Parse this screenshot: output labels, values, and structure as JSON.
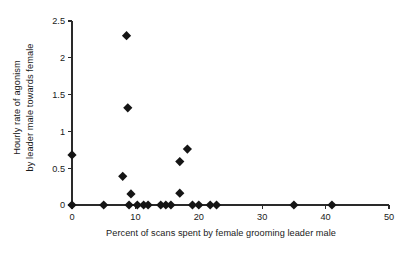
{
  "chart_data": {
    "type": "scatter",
    "title": "",
    "xlabel": "Percent of scans spent by female grooming leader male",
    "ylabel": "Hourly rate of agonism by leader male towards female",
    "ylabel_line1": "Hourly rate of agonism",
    "ylabel_line2": "by leader male towards female",
    "xlim": [
      0,
      50
    ],
    "ylim": [
      0,
      2.5
    ],
    "xticks": [
      0,
      10,
      20,
      30,
      40,
      50
    ],
    "xticklabels": [
      "0",
      "10",
      "20",
      "30",
      "40",
      "50"
    ],
    "yticks": [
      0,
      0.5,
      1,
      1.5,
      2,
      2.5
    ],
    "yticklabels": [
      "0",
      "0.5",
      "1",
      "1.5",
      "2",
      "2.5"
    ],
    "grid": false,
    "legend": false,
    "marker": "diamond",
    "marker_color": "#151515",
    "marker_size": 4.6,
    "points": [
      {
        "x": 0.0,
        "y": 0.68
      },
      {
        "x": 0.0,
        "y": 0.0
      },
      {
        "x": 5.0,
        "y": 0.0
      },
      {
        "x": 8.0,
        "y": 0.39
      },
      {
        "x": 8.6,
        "y": 2.3
      },
      {
        "x": 8.8,
        "y": 1.32
      },
      {
        "x": 9.0,
        "y": 0.0
      },
      {
        "x": 9.3,
        "y": 0.15
      },
      {
        "x": 10.3,
        "y": 0.0
      },
      {
        "x": 11.3,
        "y": 0.0
      },
      {
        "x": 12.0,
        "y": 0.0
      },
      {
        "x": 14.0,
        "y": 0.0
      },
      {
        "x": 14.8,
        "y": 0.0
      },
      {
        "x": 15.6,
        "y": 0.0
      },
      {
        "x": 17.0,
        "y": 0.16
      },
      {
        "x": 17.0,
        "y": 0.59
      },
      {
        "x": 18.2,
        "y": 0.76
      },
      {
        "x": 19.0,
        "y": 0.0
      },
      {
        "x": 20.0,
        "y": 0.0
      },
      {
        "x": 21.8,
        "y": 0.0
      },
      {
        "x": 22.8,
        "y": 0.0
      },
      {
        "x": 35.0,
        "y": 0.0
      },
      {
        "x": 41.0,
        "y": 0.0
      }
    ]
  },
  "axes": {
    "x_axis_name": "x-axis",
    "y_axis_name": "y-axis"
  }
}
